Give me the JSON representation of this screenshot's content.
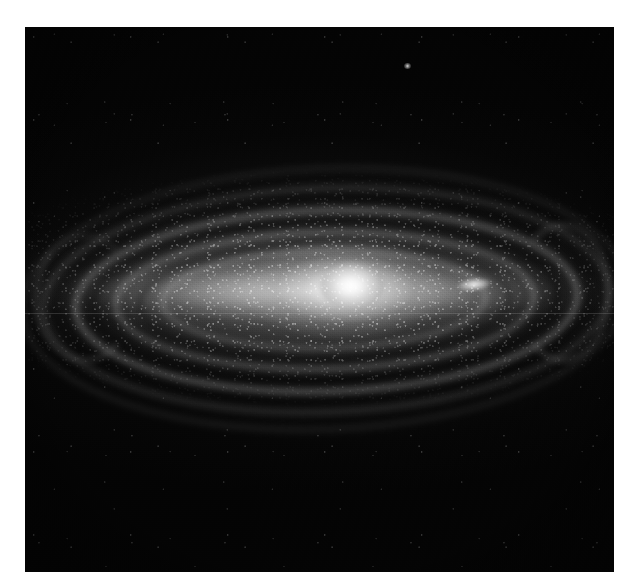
{
  "figure": {
    "kind": "astronomical-photograph",
    "caption": "",
    "colors": {
      "page_background": "#ffffff",
      "plate_background": "#040404",
      "nucleus": "#ffffff",
      "disk_glow": "#d7d7d7",
      "dust_lane": "#000000",
      "field_star": "#ffffff"
    }
  },
  "plate": {
    "left": 25,
    "top": 27,
    "width": 589,
    "height": 545
  },
  "features": {
    "nucleus_label": "nucleus",
    "bulge_label": "central bulge",
    "disk_label": "galactic disk",
    "halo_label": "outer halo",
    "dust_lane_label": "dust lane",
    "spiral_arm_label": "spiral arm",
    "companion_label": "bright knot",
    "field_star_label": "foreground star",
    "scan_artifact_label": "scan line artifact"
  }
}
